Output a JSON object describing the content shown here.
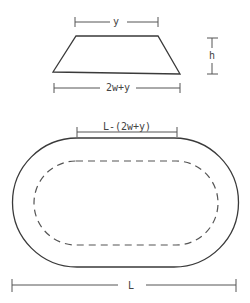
{
  "diagram": {
    "trapezoid": {
      "top_label": "y",
      "bottom_label": "2w+y",
      "height_label": "h"
    },
    "track": {
      "inner_label": "L-(2w+y)",
      "overall_label": "L"
    }
  }
}
